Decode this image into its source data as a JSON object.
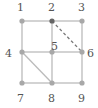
{
  "diagram": {
    "type": "graph",
    "colors": {
      "edge": "#bbbbbb",
      "node": "#a8a8a8",
      "node_active": "#666666",
      "dashed": "#777777",
      "label": "#555555"
    },
    "nodes": [
      {
        "id": "1",
        "label": "1",
        "x": 22,
        "y": 21,
        "lx": 17,
        "ly": 11
      },
      {
        "id": "2",
        "label": "2",
        "x": 52,
        "y": 21,
        "lx": 48,
        "ly": 11
      },
      {
        "id": "3",
        "label": "3",
        "x": 82,
        "y": 21,
        "lx": 78,
        "ly": 11
      },
      {
        "id": "4",
        "label": "4",
        "x": 22,
        "y": 52,
        "lx": 5,
        "ly": 57
      },
      {
        "id": "5",
        "label": "5",
        "x": 52,
        "y": 52,
        "lx": 51,
        "ly": 50
      },
      {
        "id": "6",
        "label": "6",
        "x": 82,
        "y": 52,
        "lx": 87,
        "ly": 57
      },
      {
        "id": "7",
        "label": "7",
        "x": 22,
        "y": 83,
        "lx": 17,
        "ly": 102
      },
      {
        "id": "8",
        "label": "8",
        "x": 52,
        "y": 83,
        "lx": 48,
        "ly": 102
      },
      {
        "id": "9",
        "label": "9",
        "x": 82,
        "y": 83,
        "lx": 78,
        "ly": 102
      }
    ],
    "edges": [
      {
        "from": "1",
        "to": "2",
        "style": "solid"
      },
      {
        "from": "2",
        "to": "3",
        "style": "solid"
      },
      {
        "from": "1",
        "to": "4",
        "style": "solid"
      },
      {
        "from": "2",
        "to": "5",
        "style": "solid"
      },
      {
        "from": "3",
        "to": "6",
        "style": "solid"
      },
      {
        "from": "4",
        "to": "5",
        "style": "solid"
      },
      {
        "from": "5",
        "to": "6",
        "style": "solid"
      },
      {
        "from": "4",
        "to": "7",
        "style": "solid"
      },
      {
        "from": "5",
        "to": "8",
        "style": "solid"
      },
      {
        "from": "6",
        "to": "9",
        "style": "solid"
      },
      {
        "from": "7",
        "to": "8",
        "style": "solid"
      },
      {
        "from": "8",
        "to": "9",
        "style": "solid"
      },
      {
        "from": "4",
        "to": "8",
        "style": "solid"
      },
      {
        "from": "2",
        "to": "6",
        "style": "dashed"
      }
    ],
    "active_node": "2"
  }
}
